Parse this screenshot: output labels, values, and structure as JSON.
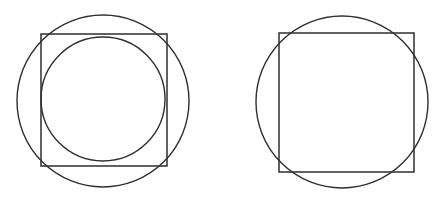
{
  "page": {
    "background_color": "#ffffff",
    "width": 447,
    "height": 202
  },
  "style": {
    "stroke_color": "#2e2e2e",
    "stroke_width_circle": 1.4,
    "stroke_width_square": 1.5,
    "fill": "none"
  },
  "figures": [
    {
      "id": "left-figure",
      "name": "square-with-inscribed-and-circumscribed-circles",
      "description": "A square containing an inscribed circle, both enclosed by a larger circumscribed circle",
      "shapes": [
        {
          "id": "left-outer-circle",
          "name": "circumscribed-circle",
          "type": "circle",
          "cx": 103,
          "cy": 101,
          "r": 86
        },
        {
          "id": "left-square",
          "name": "square",
          "type": "square",
          "x": 41,
          "y": 34,
          "width": 126,
          "height": 132
        },
        {
          "id": "left-inner-circle",
          "name": "inscribed-circle",
          "type": "circle",
          "cx": 103,
          "cy": 99,
          "r": 62
        }
      ]
    },
    {
      "id": "right-figure",
      "name": "square-with-overlapping-circle",
      "description": "A square overlapped by a circle of similar size whose arc crosses near each corner",
      "shapes": [
        {
          "id": "right-circle",
          "name": "circle",
          "type": "circle",
          "cx": 342,
          "cy": 102,
          "r": 86
        },
        {
          "id": "right-square",
          "name": "square",
          "type": "square",
          "x": 279,
          "y": 33,
          "width": 135,
          "height": 139
        }
      ]
    }
  ]
}
